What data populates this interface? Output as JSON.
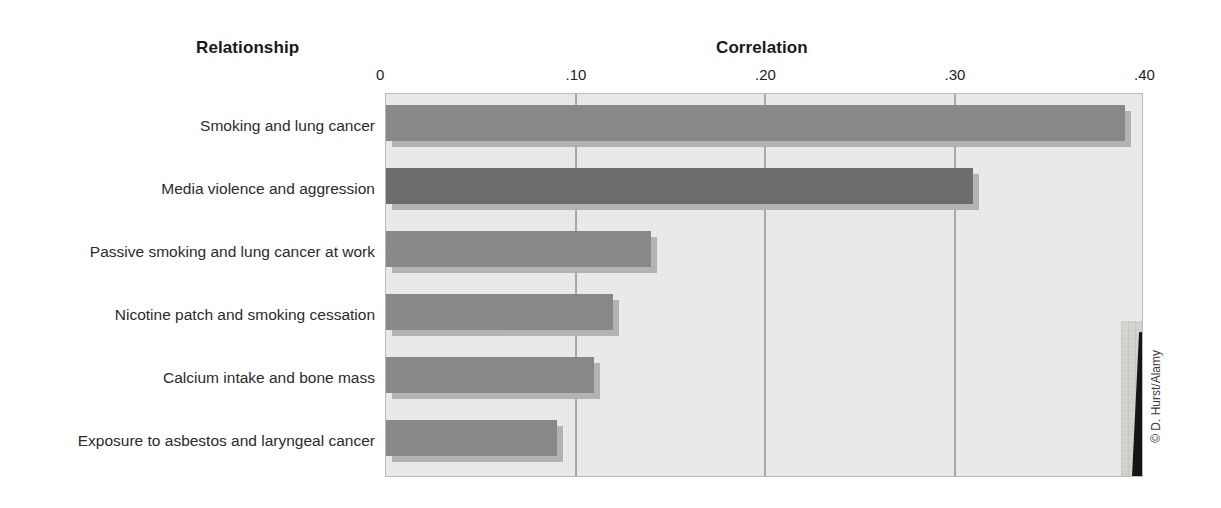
{
  "headings": {
    "relationship": "Relationship",
    "correlation": "Correlation"
  },
  "credit": "© D. Hurst/Alamy",
  "colors": {
    "bar_default": "#8a8a8a",
    "bar_highlight": "#6e6e6e",
    "bar_shadow": "#b4b5b5",
    "plot_background": "#ececec",
    "gridline": "#a9abab",
    "plot_border": "#b9bbbb",
    "text": "#231f20"
  },
  "photo": {
    "alt": "Young child aiming a toy gun at a television displaying a violent video game",
    "credit": "© D. Hurst/Alamy"
  },
  "chart_data": {
    "type": "bar",
    "orientation": "horizontal",
    "title": "",
    "xlabel": "Correlation",
    "ylabel": "Relationship",
    "xlim": [
      0,
      0.4
    ],
    "grid": true,
    "legend": "none",
    "tick_labels": [
      "0",
      ".10",
      ".20",
      ".30",
      ".40"
    ],
    "tick_values": [
      0,
      0.1,
      0.2,
      0.3,
      0.4
    ],
    "categories": [
      "Smoking and lung cancer",
      "Media violence and aggression",
      "Passive smoking and lung cancer at work",
      "Nicotine patch and smoking cessation",
      "Calcium intake and bone mass",
      "Exposure to asbestos and laryngeal cancer"
    ],
    "values": [
      0.39,
      0.31,
      0.14,
      0.12,
      0.11,
      0.09
    ],
    "highlight_index": 1,
    "bars": [
      {
        "label": "Smoking and lung cancer",
        "value": 0.39,
        "highlight": false
      },
      {
        "label": "Media violence and aggression",
        "value": 0.31,
        "highlight": true
      },
      {
        "label": "Passive smoking and lung cancer at work",
        "value": 0.14,
        "highlight": false
      },
      {
        "label": "Nicotine patch and smoking cessation",
        "value": 0.12,
        "highlight": false
      },
      {
        "label": "Calcium intake and bone mass",
        "value": 0.11,
        "highlight": false
      },
      {
        "label": "Exposure to asbestos and laryngeal cancer",
        "value": 0.09,
        "highlight": false
      }
    ]
  }
}
